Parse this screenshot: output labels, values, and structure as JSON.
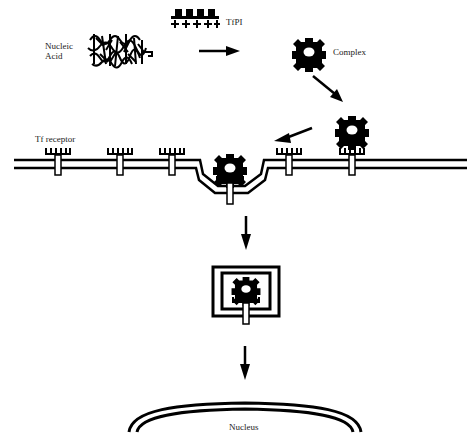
{
  "labels": {
    "nucleic_acid_line1": "Nucleic",
    "nucleic_acid_line2": "Acid",
    "tfpi": "TfPI",
    "complex": "Complex",
    "tf_receptor": "Tf receptor",
    "nucleus": "Nucleus"
  },
  "colors": {
    "ink": "#000000",
    "background": "#ffffff",
    "text": "#222222"
  },
  "steps": [
    {
      "id": "nucleic-acid",
      "description": "Nucleic acid condensed"
    },
    {
      "id": "tfpi",
      "description": "TfPI conjugate (positively charged)"
    },
    {
      "id": "complex",
      "description": "Complex formed"
    },
    {
      "id": "receptor-binding",
      "description": "Complex binds Tf receptor at membrane"
    },
    {
      "id": "endocytosis",
      "description": "Membrane invagination"
    },
    {
      "id": "endosome",
      "description": "Complex inside endosome"
    },
    {
      "id": "nucleus",
      "description": "Delivery to nucleus"
    }
  ]
}
